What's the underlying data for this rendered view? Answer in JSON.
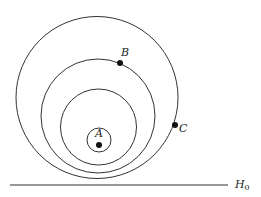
{
  "diagram": {
    "labels": {
      "A": "A",
      "B": "B",
      "C": "C",
      "H": "H",
      "H_sub": "0"
    },
    "colors": {
      "stroke": "#333333",
      "point": "#111111",
      "background": "#ffffff"
    },
    "circles": [
      {
        "name": "outer",
        "cx": 97,
        "cy": 97.5,
        "r": 81
      },
      {
        "name": "middle",
        "cx": 98,
        "cy": 116,
        "r": 57
      },
      {
        "name": "inner",
        "cx": 98.5,
        "cy": 127,
        "r": 38
      },
      {
        "name": "small",
        "cx": 99,
        "cy": 140,
        "r": 12
      }
    ],
    "points": [
      {
        "label": "A",
        "x": 99,
        "y": 145
      },
      {
        "label": "B",
        "x": 120,
        "y": 63
      },
      {
        "label": "C",
        "x": 175,
        "y": 125
      }
    ],
    "baseline": {
      "label": "H0",
      "x1": 10,
      "x2": 228,
      "y": 185
    }
  }
}
